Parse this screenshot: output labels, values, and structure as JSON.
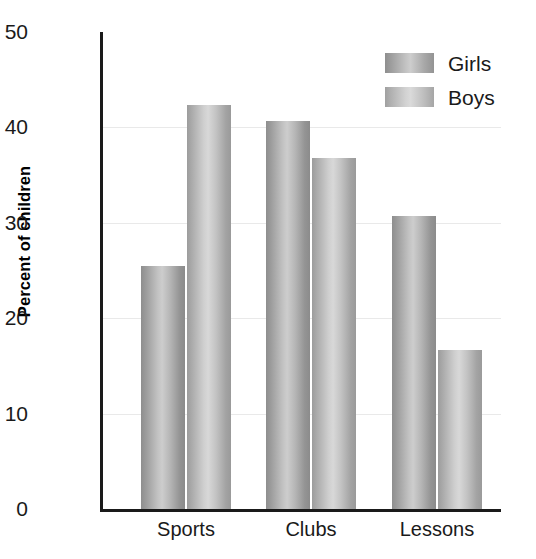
{
  "chart_data": {
    "type": "bar",
    "title": "",
    "xlabel": "",
    "ylabel": "Percent of children",
    "categories": [
      "Sports",
      "Clubs",
      "Lessons"
    ],
    "series": [
      {
        "name": "Girls",
        "values": [
          25.5,
          40.7,
          30.7
        ],
        "color": "#b4b4b4"
      },
      {
        "name": "Boys",
        "values": [
          42.4,
          36.8,
          16.7
        ],
        "color": "#c8c8c8"
      }
    ],
    "ylim": [
      0,
      50
    ],
    "yticks": [
      0,
      10,
      20,
      30,
      40,
      50
    ],
    "ytick_labels": [
      "0",
      "10",
      "20",
      "30",
      "40",
      "50"
    ],
    "grid": "horizontal",
    "grid_color": "#e9e9e9",
    "legend_position": "top-right",
    "axis_color": "#1a1a1a",
    "background": "#ffffff"
  },
  "legend": {
    "items": [
      {
        "label": "Girls"
      },
      {
        "label": "Boys"
      }
    ]
  }
}
